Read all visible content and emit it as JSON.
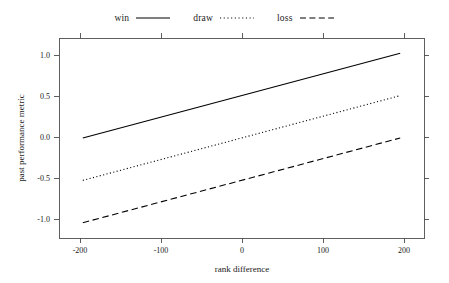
{
  "chart_data": {
    "type": "line",
    "title": "",
    "xlabel": "rank difference",
    "ylabel": "past performance metric",
    "xlim": [
      -230,
      230
    ],
    "ylim": [
      -1.18,
      1.18
    ],
    "xticks": [
      -200,
      -100,
      0,
      100,
      200
    ],
    "xticklabels": [
      "-200",
      "-100",
      "0",
      "100",
      "200"
    ],
    "yticks": [
      -1.0,
      -0.5,
      0.0,
      0.5,
      1.0
    ],
    "yticklabels": [
      "-1.0",
      "-0.5",
      "0.0",
      "0.5",
      "1.0"
    ],
    "grid": false,
    "legend_position": "top",
    "frame": "box",
    "x": [
      -200,
      200
    ],
    "series": [
      {
        "name": "win",
        "linestyle": "solid",
        "color": "#000000",
        "values": [
          0.0,
          1.0
        ]
      },
      {
        "name": "draw",
        "linestyle": "dotted",
        "color": "#000000",
        "values": [
          -0.5,
          0.5
        ]
      },
      {
        "name": "loss",
        "linestyle": "dashed",
        "color": "#000000",
        "values": [
          -1.0,
          0.0
        ]
      }
    ]
  },
  "legend": {
    "entries": [
      {
        "label": "win",
        "linestyle": "solid"
      },
      {
        "label": "draw",
        "linestyle": "dotted"
      },
      {
        "label": "loss",
        "linestyle": "dashed"
      }
    ]
  },
  "axes": {
    "x_title": "rank difference",
    "y_title": "past performance metric",
    "x_tick_labels": [
      "-200",
      "-100",
      "0",
      "100",
      "200"
    ],
    "y_tick_labels": [
      "1.0",
      "0.5",
      "0.0",
      "-0.5",
      "-1.0"
    ]
  },
  "colors": {
    "line": "#000000",
    "frame": "#4d4d4d",
    "text": "#1a1a1a",
    "background": "#ffffff"
  }
}
